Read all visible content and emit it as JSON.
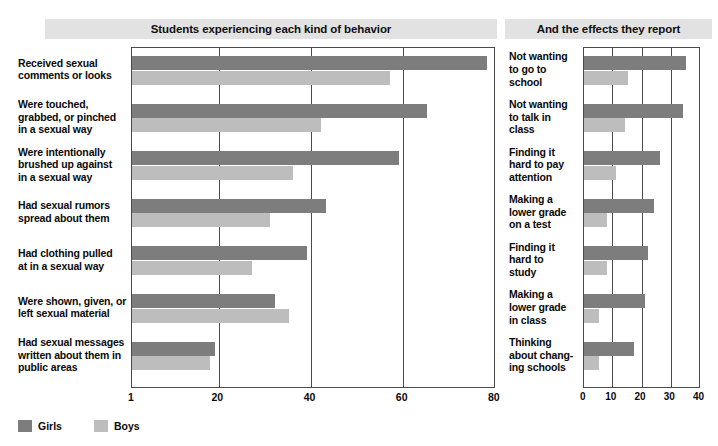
{
  "top_caption": "",
  "panels": {
    "left": {
      "title": "Students experiencing each kind of behavior"
    },
    "right": {
      "title": "And the effects they report"
    }
  },
  "legend": {
    "girls_label": "Girls",
    "boys_label": "Boys",
    "girls_color": "#7d7d7d",
    "boys_color": "#bdbdbd"
  },
  "chart_data": [
    {
      "type": "bar",
      "orientation": "horizontal",
      "title": "Students experiencing each kind of behavior",
      "xlabel": "",
      "ylabel": "",
      "xlim": [
        1,
        80
      ],
      "xticks": [
        1,
        20,
        40,
        60,
        80
      ],
      "xticklabels": [
        "1",
        "20",
        "40",
        "60",
        "80"
      ],
      "grid": true,
      "legend": [
        "Girls",
        "Boys"
      ],
      "legend_position": "below-left",
      "categories": [
        "Received sexual comments or looks",
        "Were touched, grabbed, or pinched in a sexual way",
        "Were intentionally brushed up against in a sexual way",
        "Had sexual rumors spread about them",
        "Had clothing pulled at in a sexual way",
        "Were shown, given, or left sexual material",
        "Had sexual messages written about them in public areas"
      ],
      "category_lines": [
        [
          "Received sexual",
          "comments or looks"
        ],
        [
          "Were touched,",
          "grabbed, or pinched",
          "in a sexual way"
        ],
        [
          "Were intentionally",
          "brushed up against",
          "in a sexual way"
        ],
        [
          "Had sexual rumors",
          "spread about them"
        ],
        [
          "Had clothing pulled",
          "at in a sexual way"
        ],
        [
          "Were shown, given, or",
          "left sexual material"
        ],
        [
          "Had sexual messages",
          "written about them in",
          "public areas"
        ]
      ],
      "series": [
        {
          "name": "Girls",
          "values": [
            78,
            65,
            59,
            43,
            39,
            32,
            19
          ]
        },
        {
          "name": "Boys",
          "values": [
            57,
            42,
            36,
            31,
            27,
            35,
            18
          ]
        }
      ]
    },
    {
      "type": "bar",
      "orientation": "horizontal",
      "title": "And the effects they report",
      "xlabel": "",
      "ylabel": "",
      "xlim": [
        0,
        40
      ],
      "xticks": [
        0,
        10,
        20,
        30,
        40
      ],
      "xticklabels": [
        "0",
        "10",
        "20",
        "30",
        "40"
      ],
      "grid": true,
      "legend": [
        "Girls",
        "Boys"
      ],
      "legend_position": "below-left",
      "categories": [
        "Not wanting to go to school",
        "Not wanting to talk in class",
        "Finding it hard to pay attention",
        "Making a lower grade on a test",
        "Finding it hard to study",
        "Making a lower grade in class",
        "Thinking about changing schools"
      ],
      "category_lines": [
        [
          "Not wanting",
          "to go to",
          "school"
        ],
        [
          "Not wanting",
          "to talk in",
          "class"
        ],
        [
          "Finding it",
          "hard to pay",
          "attention"
        ],
        [
          "Making a",
          "lower grade",
          "on a test"
        ],
        [
          "Finding it",
          "hard to",
          "study"
        ],
        [
          "Making a",
          "lower grade",
          "in class"
        ],
        [
          "Thinking",
          "about chang-",
          "ing schools"
        ]
      ],
      "series": [
        {
          "name": "Girls",
          "values": [
            35,
            34,
            26,
            24,
            22,
            21,
            17
          ]
        },
        {
          "name": "Boys",
          "values": [
            15,
            14,
            11,
            8,
            8,
            5,
            5
          ]
        }
      ]
    }
  ]
}
